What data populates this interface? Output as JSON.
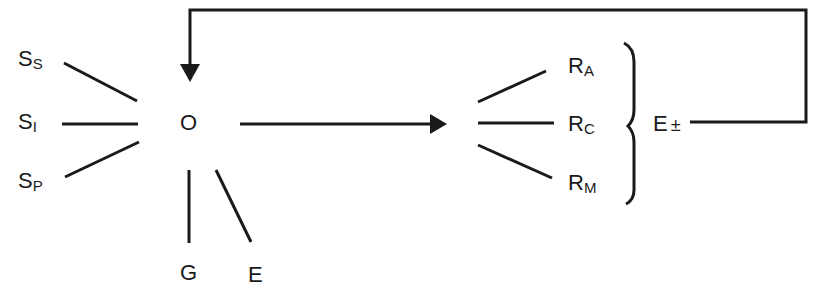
{
  "diagram": {
    "stimuli": [
      {
        "main": "S",
        "sub": "S"
      },
      {
        "main": "S",
        "sub": "I"
      },
      {
        "main": "S",
        "sub": "P"
      }
    ],
    "organism": "O",
    "organism_inputs": [
      {
        "label": "G"
      },
      {
        "label": "E"
      }
    ],
    "responses": [
      {
        "main": "R",
        "sub": "A"
      },
      {
        "main": "R",
        "sub": "C"
      },
      {
        "main": "R",
        "sub": "M"
      }
    ],
    "outcome": {
      "main": "E",
      "sign": "±"
    },
    "colors": {
      "line": "#1a1a1a",
      "background": "#ffffff"
    }
  }
}
